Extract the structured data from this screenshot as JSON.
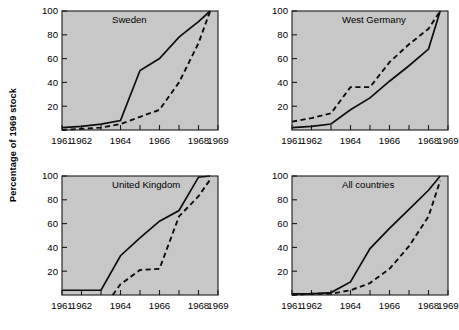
{
  "figure": {
    "ylabel": "Percentage of 1969 stock",
    "background_color": "#ffffff",
    "plot_background_color": "#c7c7c7",
    "line_color": "#0d0d0d"
  },
  "chart_data": {
    "type": "line",
    "title": "",
    "xlabel": "",
    "ylabel": "Percentage of 1969 stock",
    "xlim": [
      1961,
      1969
    ],
    "ylim": [
      0,
      100
    ],
    "grid": false,
    "legend": "none",
    "layout": "2x2 small multiples",
    "x_ticks": [
      1961,
      1962,
      1963,
      1964,
      1965,
      1966,
      1967,
      1968,
      1969
    ],
    "x_tick_labels": [
      "1961",
      "1962",
      "",
      "1964",
      "",
      "1966",
      "",
      "1968",
      "1969"
    ],
    "x_tick_labels_shown": [
      "1961",
      "1962",
      "1964",
      "1966",
      "1968",
      "1969"
    ],
    "y_ticks": [
      20,
      40,
      60,
      80,
      100
    ],
    "y_tick_labels": [
      "20",
      "40",
      "60",
      "80",
      "100"
    ],
    "panels": [
      {
        "title": "Sweden",
        "position": "top-left",
        "series": [
          {
            "name": "solid",
            "style": "solid",
            "x": [
              1961,
              1962,
              1963,
              1964,
              1965,
              1966,
              1967,
              1968,
              1968.6
            ],
            "values": [
              2,
              3,
              5,
              8,
              50,
              60,
              78,
              91,
              100
            ]
          },
          {
            "name": "dashed",
            "style": "dashed",
            "x": [
              1961,
              1962,
              1963,
              1964,
              1965,
              1966,
              1967,
              1968,
              1968.6
            ],
            "values": [
              0,
              1,
              2,
              5,
              11,
              17,
              40,
              73,
              100
            ]
          }
        ]
      },
      {
        "title": "West Germany",
        "position": "top-right",
        "series": [
          {
            "name": "solid",
            "style": "solid",
            "x": [
              1961,
              1962,
              1963,
              1964,
              1965,
              1966,
              1967,
              1968,
              1968.6
            ],
            "values": [
              2,
              3,
              5,
              17,
              27,
              41,
              54,
              68,
              100
            ]
          },
          {
            "name": "dashed",
            "style": "dashed",
            "x": [
              1961,
              1962,
              1963,
              1964,
              1965,
              1966,
              1967,
              1968,
              1968.6
            ],
            "values": [
              7,
              10,
              14,
              36,
              36,
              57,
              72,
              85,
              100
            ]
          }
        ]
      },
      {
        "title": "United Kingdom",
        "position": "bottom-left",
        "series": [
          {
            "name": "solid",
            "style": "solid",
            "x": [
              1961,
              1962,
              1963,
              1964,
              1965,
              1966,
              1967,
              1968,
              1968.6
            ],
            "values": [
              4,
              4,
              4,
              33,
              48,
              62,
              71,
              99,
              100
            ]
          },
          {
            "name": "dashed",
            "style": "dashed",
            "x": [
              1963.6,
              1964,
              1965,
              1966,
              1967,
              1968,
              1968.6
            ],
            "values": [
              0,
              9,
              21,
              22,
              66,
              83,
              97
            ]
          }
        ]
      },
      {
        "title": "All countries",
        "position": "bottom-right",
        "series": [
          {
            "name": "solid",
            "style": "solid",
            "x": [
              1961,
              1962,
              1963,
              1964,
              1965,
              1966,
              1967,
              1968,
              1968.6
            ],
            "values": [
              1,
              1,
              2,
              11,
              39,
              56,
              72,
              88,
              100
            ]
          },
          {
            "name": "dashed",
            "style": "dashed",
            "x": [
              1961,
              1962,
              1963,
              1964,
              1965,
              1966,
              1967,
              1968,
              1968.6
            ],
            "values": [
              0,
              1,
              1,
              4,
              10,
              22,
              41,
              66,
              96
            ]
          }
        ]
      }
    ]
  }
}
